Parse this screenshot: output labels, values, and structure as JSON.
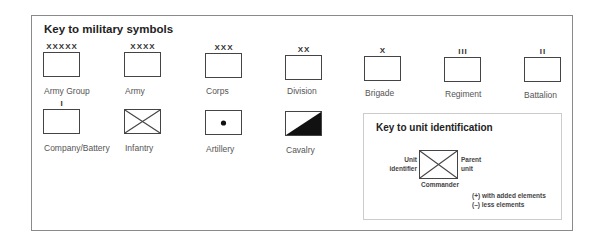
{
  "title": "Key to military symbols",
  "symbols": [
    {
      "label": "Army Group",
      "mark": "XXXXX"
    },
    {
      "label": "Army",
      "mark": "XXXX"
    },
    {
      "label": "Corps",
      "mark": "XXX"
    },
    {
      "label": "Division",
      "mark": "XX"
    },
    {
      "label": "Brigade",
      "mark": "X"
    },
    {
      "label": "Regiment",
      "mark": "III"
    },
    {
      "label": "Battalion",
      "mark": "II"
    },
    {
      "label": "Company/Battery",
      "mark": "I"
    },
    {
      "label": "Infantry",
      "mark": ""
    },
    {
      "label": "Artillery",
      "mark": ""
    },
    {
      "label": "Cavalry",
      "mark": ""
    }
  ],
  "unit_key": {
    "title": "Key to unit identification",
    "unit_identifier": [
      "Unit",
      "identifier"
    ],
    "parent_unit": [
      "Parent",
      "unit"
    ],
    "commander": "Commander",
    "notes": [
      "(+) with added elements",
      "(–) less elements"
    ]
  }
}
